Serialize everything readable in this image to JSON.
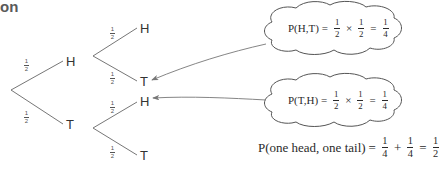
{
  "heading": {
    "text": "on"
  },
  "tree": {
    "level1": [
      {
        "label": "H",
        "prob_num": "1",
        "prob_den": "2"
      },
      {
        "label": "T",
        "prob_num": "1",
        "prob_den": "2"
      }
    ],
    "level2": [
      {
        "label": "H",
        "prob_num": "1",
        "prob_den": "2"
      },
      {
        "label": "T",
        "prob_num": "1",
        "prob_den": "2"
      },
      {
        "label": "H",
        "prob_num": "1",
        "prob_den": "2"
      },
      {
        "label": "T",
        "prob_num": "1",
        "prob_den": "2"
      }
    ]
  },
  "bubbles": [
    {
      "lhs": "P(H,T)",
      "eq": "=",
      "a_num": "1",
      "a_den": "2",
      "op": "×",
      "b_num": "1",
      "b_den": "2",
      "eq2": "=",
      "r_num": "1",
      "r_den": "4"
    },
    {
      "lhs": "P(T,H)",
      "eq": "=",
      "a_num": "1",
      "a_den": "2",
      "op": "×",
      "b_num": "1",
      "b_den": "2",
      "eq2": "=",
      "r_num": "1",
      "r_den": "4"
    }
  ],
  "summary": {
    "lhs": "P(one head, one tail)",
    "eq": "=",
    "a_num": "1",
    "a_den": "4",
    "op": "+",
    "b_num": "1",
    "b_den": "4",
    "eq2": "=",
    "r_num": "1",
    "r_den": "2"
  },
  "colors": {
    "line": "#666666",
    "arrow": "#777777",
    "text": "#2a2a2a"
  }
}
